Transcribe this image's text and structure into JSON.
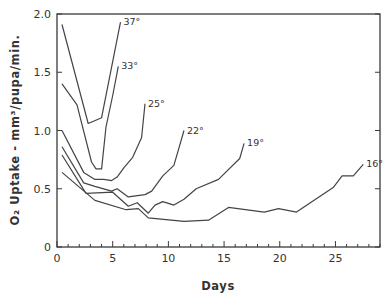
{
  "chart_data": {
    "type": "line",
    "title": "",
    "xlabel": "Days",
    "ylabel": "O₂ Uptake - mm³/pupa/min.",
    "xlim": [
      0,
      29
    ],
    "ylim": [
      0,
      2.0
    ],
    "xticks": [
      0,
      5,
      10,
      15,
      20,
      25
    ],
    "xtick_labels": [
      "0",
      "5",
      "10",
      "15",
      "20",
      "25"
    ],
    "xminor_step": 1,
    "yticks": [
      0,
      0.5,
      1.0,
      1.5,
      2.0
    ],
    "ytick_labels": [
      "0",
      "0.5",
      "1.0",
      "1.5",
      "2.0"
    ],
    "grid": false,
    "legend": "inline labels at line ends",
    "series": [
      {
        "name": "37°",
        "points": [
          [
            0.45,
            1.91
          ],
          [
            2.8,
            1.06
          ],
          [
            4.0,
            1.11
          ],
          [
            5.7,
            1.93
          ]
        ]
      },
      {
        "name": "33°",
        "points": [
          [
            0.45,
            1.4
          ],
          [
            1.8,
            1.22
          ],
          [
            3.1,
            0.73
          ],
          [
            3.5,
            0.67
          ],
          [
            4.0,
            0.67
          ],
          [
            4.4,
            1.03
          ],
          [
            5.0,
            1.3
          ],
          [
            5.5,
            1.55
          ]
        ]
      },
      {
        "name": "25°",
        "points": [
          [
            0.45,
            1.0
          ],
          [
            2.4,
            0.64
          ],
          [
            3.4,
            0.58
          ],
          [
            4.2,
            0.58
          ],
          [
            4.9,
            0.57
          ],
          [
            5.4,
            0.6
          ],
          [
            6.0,
            0.68
          ],
          [
            6.8,
            0.77
          ],
          [
            7.6,
            0.94
          ],
          [
            7.9,
            1.23
          ]
        ]
      },
      {
        "name": "22°",
        "points": [
          [
            0.45,
            0.86
          ],
          [
            2.4,
            0.55
          ],
          [
            3.4,
            0.52
          ],
          [
            4.9,
            0.48
          ],
          [
            5.4,
            0.5
          ],
          [
            6.4,
            0.43
          ],
          [
            7.9,
            0.45
          ],
          [
            8.5,
            0.48
          ],
          [
            9.5,
            0.61
          ],
          [
            10.5,
            0.7
          ],
          [
            11.4,
            1.0
          ]
        ]
      },
      {
        "name": "19°",
        "points": [
          [
            0.45,
            0.79
          ],
          [
            2.6,
            0.46
          ],
          [
            5.0,
            0.47
          ],
          [
            6.4,
            0.35
          ],
          [
            7.2,
            0.38
          ],
          [
            8.2,
            0.29
          ],
          [
            8.8,
            0.36
          ],
          [
            9.5,
            0.39
          ],
          [
            10.5,
            0.36
          ],
          [
            11.4,
            0.41
          ],
          [
            12.5,
            0.5
          ],
          [
            14.5,
            0.58
          ],
          [
            16.4,
            0.76
          ],
          [
            16.8,
            0.89
          ]
        ]
      },
      {
        "name": "16°",
        "points": [
          [
            0.45,
            0.64
          ],
          [
            3.4,
            0.4
          ],
          [
            6.2,
            0.32
          ],
          [
            7.3,
            0.33
          ],
          [
            8.2,
            0.25
          ],
          [
            11.4,
            0.22
          ],
          [
            13.6,
            0.23
          ],
          [
            15.4,
            0.34
          ],
          [
            18.6,
            0.3
          ],
          [
            19.9,
            0.33
          ],
          [
            21.5,
            0.3
          ],
          [
            24.8,
            0.51
          ],
          [
            25.6,
            0.61
          ],
          [
            26.6,
            0.61
          ],
          [
            27.5,
            0.71
          ]
        ]
      }
    ]
  }
}
